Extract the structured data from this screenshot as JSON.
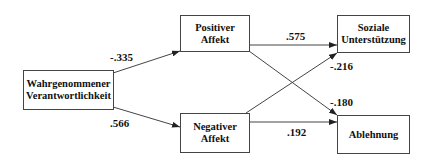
{
  "diagram": {
    "type": "path-model",
    "nodes": {
      "perceived_responsibility": {
        "line1": "Wahrgenommener",
        "line2": "Verantwortlichkeit"
      },
      "positive_affect": {
        "line1": "Positiver",
        "line2": "Affekt"
      },
      "negative_affect": {
        "line1": "Negativer",
        "line2": "Affekt"
      },
      "social_support": {
        "line1": "Soziale",
        "line2": "Unterstützung"
      },
      "rejection": {
        "line1": "Ablehnung"
      }
    },
    "edges": [
      {
        "from": "perceived_responsibility",
        "to": "positive_affect",
        "coef": "-.335"
      },
      {
        "from": "perceived_responsibility",
        "to": "negative_affect",
        "coef": ".566"
      },
      {
        "from": "positive_affect",
        "to": "social_support",
        "coef": ".575"
      },
      {
        "from": "positive_affect",
        "to": "rejection",
        "coef": "-.180"
      },
      {
        "from": "negative_affect",
        "to": "social_support",
        "coef": "-.216"
      },
      {
        "from": "negative_affect",
        "to": "rejection",
        "coef": ".192"
      }
    ],
    "colors": {
      "line": "#444444",
      "text": "#111111",
      "background": "#ffffff"
    }
  }
}
